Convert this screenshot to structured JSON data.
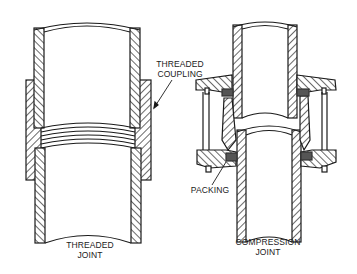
{
  "diagram": {
    "figures": [
      {
        "id": "threaded",
        "caption_line1": "THREADED",
        "caption_line2": "JOINT",
        "callout_line1": "THREADED",
        "callout_line2": "COUPLING"
      },
      {
        "id": "compression",
        "caption_line1": "COMPRESSION",
        "caption_line2": "JOINT",
        "callout": "PACKING"
      }
    ],
    "colors": {
      "ink": "#1a1a1a",
      "packing": "#555555",
      "background": "#ffffff"
    }
  }
}
